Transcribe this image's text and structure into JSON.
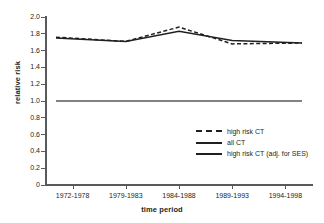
{
  "chart_data": {
    "type": "line",
    "title": "",
    "xlabel": "time period",
    "ylabel": "relative risk",
    "categories": [
      "1972-1978",
      "1979-1983",
      "1984-1988",
      "1989-1993",
      "1994-1998"
    ],
    "ylim": [
      0,
      2.0
    ],
    "yticks": [
      "0",
      "0.2",
      "0.4",
      "0.6",
      "0.8",
      "1.0",
      "1.2",
      "1.4",
      "1.6",
      "1.8",
      "2.0"
    ],
    "ytick_values": [
      0,
      0.2,
      0.4,
      0.6,
      0.8,
      1.0,
      1.2,
      1.4,
      1.6,
      1.8,
      2.0
    ],
    "grid": false,
    "legend_position": "inside-lower-right",
    "series": [
      {
        "name": "high risk CT",
        "style": "dashed",
        "color": "#231f20",
        "values": [
          1.76,
          1.71,
          1.88,
          1.68,
          1.69
        ]
      },
      {
        "name": "all CT",
        "style": "solid",
        "color": "#231f20",
        "values": [
          1.75,
          1.71,
          1.83,
          1.72,
          1.69
        ]
      },
      {
        "name": "high risk CT (adj. for SES)",
        "style": "solid",
        "color": "#58595b",
        "values": [
          1.0,
          1.0,
          1.0,
          1.0,
          1.0
        ]
      }
    ]
  },
  "legend": {
    "items": [
      {
        "label": "high risk CT",
        "style": "dashed"
      },
      {
        "label": "all CT",
        "style": "solid"
      },
      {
        "label": "high risk CT (adj. for SES)",
        "style": "solid"
      }
    ]
  }
}
